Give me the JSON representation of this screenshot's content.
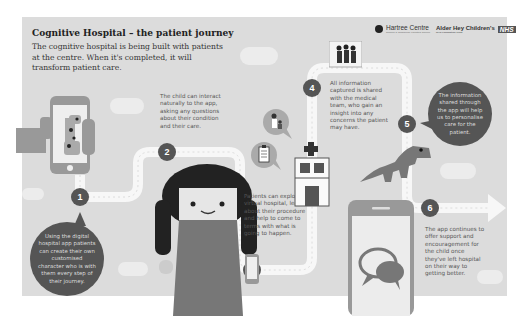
{
  "header": {
    "title": "Cognitive Hospital – the patient journey",
    "intro": "The cognitive hospital is being built with patients at the centre. When it's completed, it will transform patient care."
  },
  "logos": {
    "hartree": "Hartree Centre",
    "hartree_sub": "Science & Technology Facilities Council",
    "alder_hey": "Alder Hey Children's",
    "alder_hey_sub": "NHS Foundation Trust",
    "nhs": "NHS"
  },
  "steps": [
    {
      "number": "1",
      "text": "Using the digital hospital app patients can create their own customised character who is with them every step of their journey."
    },
    {
      "number": "2",
      "text": "The child can interact naturally to the app, asking any questions about their condition and their care."
    },
    {
      "number": "3",
      "text": "Patients can explore a virtual hospital, learn about their procedure and help to come to terms with what is going to happen."
    },
    {
      "number": "4",
      "text": "All information captured is shared with the medical team, who gain an insight into any concerns the patient may have."
    },
    {
      "number": "5",
      "text": "The information shared through the app will help us to personalise care for the patient."
    },
    {
      "number": "6",
      "text": "The app continues to offer support and encouragement for the child once they've left hospital on their way to getting better."
    }
  ],
  "colors": {
    "panel": "#dcdcdc",
    "dark": "#555555",
    "mid": "#888888",
    "path": "#f7f7f7"
  }
}
